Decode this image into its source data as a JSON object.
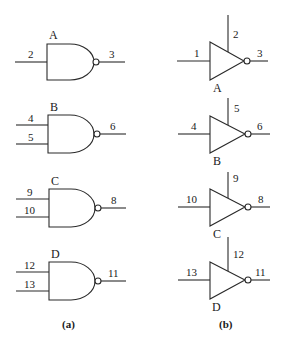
{
  "figure": {
    "panel_a": {
      "caption": "(a)",
      "description": "Four 2-style NAND gates (A single input, B-D two inputs)",
      "gates": [
        {
          "label": "A",
          "inputs": [
            "2"
          ],
          "output": "3"
        },
        {
          "label": "B",
          "inputs": [
            "4",
            "5"
          ],
          "output": "6"
        },
        {
          "label": "C",
          "inputs": [
            "9",
            "10"
          ],
          "output": "8"
        },
        {
          "label": "D",
          "inputs": [
            "12",
            "13"
          ],
          "output": "11"
        }
      ]
    },
    "panel_b": {
      "caption": "(b)",
      "description": "Four tri-state inverters with enable pins",
      "gates": [
        {
          "label": "A",
          "input": "1",
          "enable": "2",
          "output": "3"
        },
        {
          "label": "B",
          "input": "4",
          "enable": "5",
          "output": "6"
        },
        {
          "label": "C",
          "input": "10",
          "enable": "9",
          "output": "8"
        },
        {
          "label": "D",
          "input": "13",
          "enable": "12",
          "output": "11"
        }
      ]
    }
  },
  "colors": {
    "line": "#2a2a2a",
    "background": "#ffffff"
  }
}
